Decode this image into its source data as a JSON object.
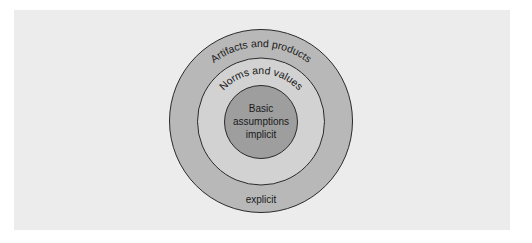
{
  "diagram": {
    "type": "concentric-circles",
    "layers": [
      {
        "id": "outer",
        "label": "Artifacts and products",
        "bottom_label": "explicit",
        "fill": "#b8b8b8",
        "stroke": "#2a2a2a"
      },
      {
        "id": "middle",
        "label": "Norms and values",
        "fill": "#d2d2d2",
        "stroke": "#2a2a2a"
      },
      {
        "id": "inner",
        "label_lines": [
          "Basic",
          "assumptions",
          "implicit"
        ],
        "fill": "#9e9e9e",
        "stroke": "#2a2a2a"
      }
    ],
    "panel_background": "#ececec",
    "page_background": "#ffffff"
  }
}
